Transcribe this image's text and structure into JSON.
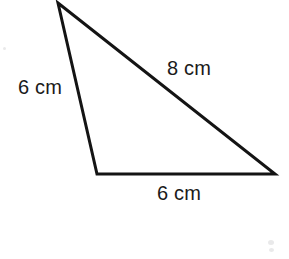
{
  "figure": {
    "kind": "geometry-diagram",
    "shape": "triangle",
    "background_color": "#ffffff",
    "stroke_color": "#141414",
    "stroke_width": 3,
    "text_color": "#1a1a1a",
    "canvas": {
      "width": 289,
      "height": 259
    },
    "vertices": {
      "apex": {
        "name": "A",
        "x": 58,
        "y": 3
      },
      "bottom_left": {
        "name": "B",
        "x": 97,
        "y": 174
      },
      "bottom_right": {
        "name": "C",
        "x": 275,
        "y": 174
      }
    },
    "polygon_points": "58,3 275,174 97,174",
    "sides": [
      {
        "id": "left",
        "from": "apex",
        "to": "bottom_left",
        "label": "6 cm",
        "value": 6,
        "unit": "cm"
      },
      {
        "id": "hyp",
        "from": "apex",
        "to": "bottom_right",
        "label": "8 cm",
        "value": 8,
        "unit": "cm"
      },
      {
        "id": "bottom",
        "from": "bottom_left",
        "to": "bottom_right",
        "label": "6 cm",
        "value": 6,
        "unit": "cm"
      }
    ],
    "labels": {
      "left": "6 cm",
      "hypotenuse": "8 cm",
      "bottom": "6 cm"
    }
  }
}
